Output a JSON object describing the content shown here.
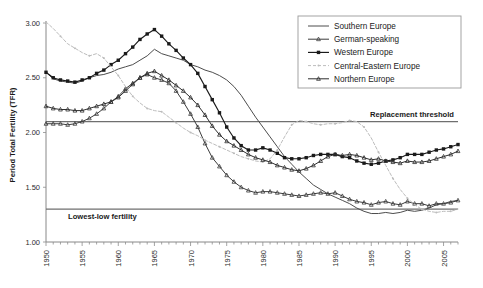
{
  "chart_data": {
    "type": "line",
    "title": "",
    "xlabel": "",
    "ylabel": "Period Total Fertility (TFR)",
    "xlim": [
      1950,
      2007
    ],
    "ylim": [
      1.0,
      3.05
    ],
    "y_ticks": [
      "1.00",
      "1.50",
      "2.00",
      "2.50",
      "3.00"
    ],
    "y_tick_values": [
      1.0,
      1.5,
      2.0,
      2.5,
      3.0
    ],
    "x_ticks": [
      "1950",
      "1955",
      "1960",
      "1965",
      "1970",
      "1975",
      "1980",
      "1985",
      "1990",
      "1995",
      "2000",
      "2005"
    ],
    "x_tick_values": [
      1950,
      1955,
      1960,
      1965,
      1970,
      1975,
      1980,
      1985,
      1990,
      1995,
      2000,
      2005
    ],
    "x_minor_step": 1,
    "grid": false,
    "legend_position": "top-right",
    "annotations": [
      {
        "name": "replacement-threshold",
        "label": "Replacement threshold",
        "value": 2.1
      },
      {
        "name": "lowest-low-fertility",
        "label": "Lowest-low fertility",
        "value": 1.3
      }
    ],
    "x": [
      1950,
      1951,
      1952,
      1953,
      1954,
      1955,
      1956,
      1957,
      1958,
      1959,
      1960,
      1961,
      1962,
      1963,
      1964,
      1965,
      1966,
      1967,
      1968,
      1969,
      1970,
      1971,
      1972,
      1973,
      1974,
      1975,
      1976,
      1977,
      1978,
      1979,
      1980,
      1981,
      1982,
      1983,
      1984,
      1985,
      1986,
      1987,
      1988,
      1989,
      1990,
      1991,
      1992,
      1993,
      1994,
      1995,
      1996,
      1997,
      1998,
      1999,
      2000,
      2001,
      2002,
      2003,
      2004,
      2005,
      2006,
      2007
    ],
    "series": [
      {
        "name": "Southern Europe",
        "style": "solid-plain",
        "color": "#4d4d4d",
        "marker": "none",
        "values": [
          2.55,
          2.49,
          2.47,
          2.46,
          2.45,
          2.47,
          2.5,
          2.52,
          2.53,
          2.55,
          2.58,
          2.6,
          2.62,
          2.66,
          2.7,
          2.76,
          2.72,
          2.7,
          2.68,
          2.66,
          2.62,
          2.6,
          2.57,
          2.55,
          2.52,
          2.48,
          2.42,
          2.34,
          2.24,
          2.14,
          2.05,
          1.96,
          1.87,
          1.78,
          1.71,
          1.64,
          1.58,
          1.52,
          1.48,
          1.44,
          1.41,
          1.38,
          1.35,
          1.31,
          1.28,
          1.26,
          1.26,
          1.27,
          1.26,
          1.27,
          1.29,
          1.28,
          1.29,
          1.31,
          1.34,
          1.35,
          1.37,
          1.38
        ]
      },
      {
        "name": "German-speaking",
        "style": "solid-small-marker",
        "color": "#3c3c3c",
        "marker": "tri",
        "values": [
          2.08,
          2.08,
          2.08,
          2.07,
          2.08,
          2.1,
          2.13,
          2.17,
          2.22,
          2.28,
          2.33,
          2.4,
          2.45,
          2.5,
          2.53,
          2.5,
          2.48,
          2.45,
          2.38,
          2.28,
          2.17,
          2.05,
          1.9,
          1.77,
          1.69,
          1.61,
          1.55,
          1.5,
          1.47,
          1.45,
          1.46,
          1.46,
          1.45,
          1.44,
          1.43,
          1.42,
          1.43,
          1.44,
          1.45,
          1.44,
          1.45,
          1.42,
          1.39,
          1.37,
          1.36,
          1.34,
          1.36,
          1.37,
          1.35,
          1.34,
          1.37,
          1.35,
          1.35,
          1.33,
          1.35,
          1.35,
          1.36,
          1.38
        ]
      },
      {
        "name": "Western Europe",
        "style": "solid-square-marker",
        "color": "#1a1a1a",
        "marker": "square",
        "values": [
          2.55,
          2.5,
          2.48,
          2.47,
          2.46,
          2.48,
          2.5,
          2.54,
          2.57,
          2.62,
          2.66,
          2.72,
          2.78,
          2.85,
          2.9,
          2.94,
          2.88,
          2.81,
          2.75,
          2.68,
          2.62,
          2.54,
          2.42,
          2.3,
          2.18,
          2.05,
          1.95,
          1.88,
          1.84,
          1.84,
          1.86,
          1.84,
          1.81,
          1.77,
          1.76,
          1.76,
          1.77,
          1.79,
          1.8,
          1.8,
          1.8,
          1.78,
          1.77,
          1.74,
          1.72,
          1.71,
          1.72,
          1.74,
          1.75,
          1.77,
          1.8,
          1.8,
          1.8,
          1.82,
          1.84,
          1.85,
          1.87,
          1.89
        ]
      },
      {
        "name": "Central-Eastern Europe",
        "style": "dashed-light",
        "color": "#bdbdbd",
        "marker": "tiny",
        "values": [
          3.01,
          2.95,
          2.88,
          2.81,
          2.77,
          2.73,
          2.7,
          2.72,
          2.68,
          2.6,
          2.52,
          2.42,
          2.33,
          2.27,
          2.22,
          2.2,
          2.19,
          2.14,
          2.09,
          2.04,
          2.0,
          1.97,
          1.93,
          1.9,
          1.87,
          1.84,
          1.81,
          1.78,
          1.76,
          1.74,
          1.73,
          1.76,
          1.84,
          1.96,
          2.07,
          2.11,
          2.1,
          2.08,
          2.07,
          2.08,
          2.08,
          2.09,
          2.11,
          2.1,
          2.05,
          1.95,
          1.82,
          1.7,
          1.58,
          1.48,
          1.4,
          1.34,
          1.3,
          1.28,
          1.27,
          1.28,
          1.28,
          1.3
        ]
      },
      {
        "name": "Northern Europe",
        "style": "solid-tri-marker",
        "color": "#2e2e2e",
        "marker": "tri",
        "values": [
          2.24,
          2.22,
          2.21,
          2.21,
          2.2,
          2.2,
          2.22,
          2.24,
          2.26,
          2.28,
          2.32,
          2.38,
          2.44,
          2.5,
          2.54,
          2.56,
          2.52,
          2.48,
          2.43,
          2.38,
          2.32,
          2.25,
          2.16,
          2.06,
          1.98,
          1.92,
          1.88,
          1.84,
          1.8,
          1.77,
          1.75,
          1.73,
          1.7,
          1.68,
          1.66,
          1.65,
          1.67,
          1.7,
          1.74,
          1.78,
          1.8,
          1.79,
          1.8,
          1.79,
          1.77,
          1.75,
          1.76,
          1.74,
          1.73,
          1.72,
          1.74,
          1.73,
          1.73,
          1.74,
          1.76,
          1.78,
          1.8,
          1.83
        ]
      }
    ]
  },
  "legend": {
    "items": [
      {
        "label": "Southern Europe"
      },
      {
        "label": "German-speaking"
      },
      {
        "label": "Western Europe"
      },
      {
        "label": "Central-Eastern Europe"
      },
      {
        "label": "Northern Europe"
      }
    ]
  }
}
